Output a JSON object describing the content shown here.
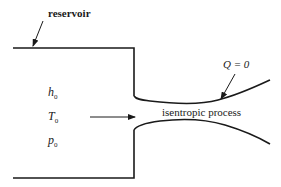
{
  "diagram": {
    "labels": {
      "reservoir": "reservoir",
      "heat": "Q = 0",
      "process": "isentropic process"
    },
    "stagnation_properties": [
      {
        "symbol": "h",
        "subscript": "0"
      },
      {
        "symbol": "T",
        "subscript": "0"
      },
      {
        "symbol": "p",
        "subscript": "0"
      }
    ],
    "colors": {
      "line": "#1a1a1a",
      "background": "#ffffff"
    }
  }
}
